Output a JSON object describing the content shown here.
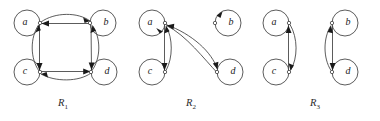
{
  "figure": {
    "background_color": "#ffffff",
    "stroke_color": "#4a4a4a",
    "arrow_color": "#1a1a1a",
    "label_color": "#222222"
  },
  "graphs": [
    {
      "id": "R1",
      "caption_base": "R",
      "caption_sub": "1",
      "caption_x": 58,
      "caption_y": 97,
      "nodes": [
        {
          "label": "a",
          "cx": 27,
          "cy": 23,
          "r": 13,
          "dot_x": 40,
          "dot_y": 23
        },
        {
          "label": "b",
          "cx": 103,
          "cy": 23,
          "r": 13,
          "dot_x": 90,
          "dot_y": 23
        },
        {
          "label": "c",
          "cx": 27,
          "cy": 72,
          "r": 13,
          "dot_x": 40,
          "dot_y": 72
        },
        {
          "label": "d",
          "cx": 104,
          "cy": 72,
          "r": 13,
          "dot_x": 91,
          "dot_y": 72
        }
      ],
      "edges": [
        "a->b",
        "b->a",
        "a->c",
        "c->a",
        "b->d",
        "d->b",
        "c->d",
        "d->c"
      ]
    },
    {
      "id": "R2",
      "caption_base": "R",
      "caption_sub": "2",
      "caption_x": 186,
      "caption_y": 97,
      "nodes": [
        {
          "label": "a",
          "cx": 152,
          "cy": 23,
          "r": 13,
          "dot_x": 165,
          "dot_y": 23
        },
        {
          "label": "b",
          "cx": 228,
          "cy": 23,
          "r": 13,
          "dot_x": 215,
          "dot_y": 23
        },
        {
          "label": "c",
          "cx": 152,
          "cy": 72,
          "r": 13,
          "dot_x": 165,
          "dot_y": 72
        },
        {
          "label": "d",
          "cx": 230,
          "cy": 72,
          "r": 13,
          "dot_x": 217,
          "dot_y": 72
        }
      ],
      "edges": [
        "a->a",
        "b->b",
        "a->c",
        "c->a",
        "a->d",
        "d->a"
      ]
    },
    {
      "id": "R3",
      "caption_base": "R",
      "caption_sub": "3",
      "caption_x": 310,
      "caption_y": 97,
      "nodes": [
        {
          "label": "a",
          "cx": 276,
          "cy": 23,
          "r": 13,
          "dot_x": 289,
          "dot_y": 23
        },
        {
          "label": "b",
          "cx": 345,
          "cy": 23,
          "r": 13,
          "dot_x": 332,
          "dot_y": 23
        },
        {
          "label": "c",
          "cx": 276,
          "cy": 72,
          "r": 13,
          "dot_x": 289,
          "dot_y": 72
        },
        {
          "label": "d",
          "cx": 345,
          "cy": 72,
          "r": 13,
          "dot_x": 332,
          "dot_y": 72
        }
      ],
      "edges": [
        "a->c",
        "c->a",
        "b->d",
        "d->b"
      ]
    }
  ]
}
